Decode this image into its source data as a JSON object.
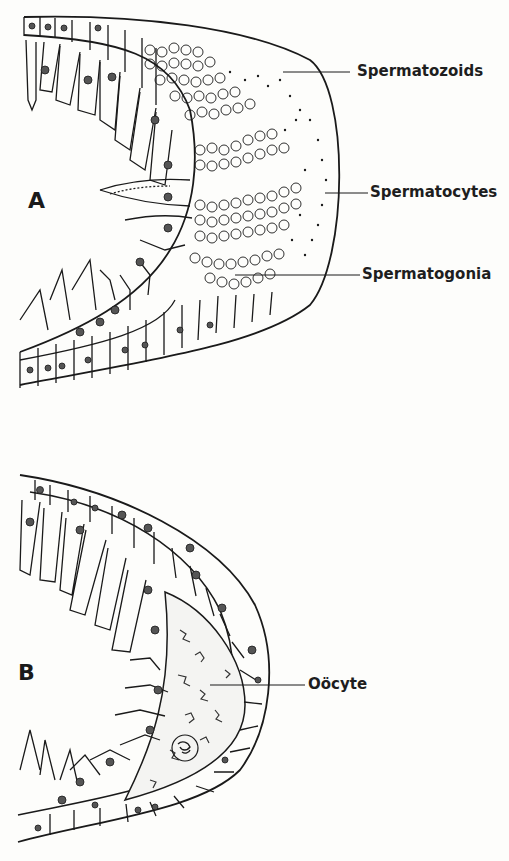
{
  "figure": {
    "panel_a": {
      "letter": "A",
      "labels": {
        "spermatozoids": "Spermatozoids",
        "spermatocytes": "Spermatocytes",
        "spermatogonia": "Spermatogonia"
      }
    },
    "panel_b": {
      "letter": "B",
      "labels": {
        "oocyte": "Oöcyte"
      }
    }
  },
  "colors": {
    "ink": "#1a1a1a",
    "paper": "#fdfdfb"
  }
}
